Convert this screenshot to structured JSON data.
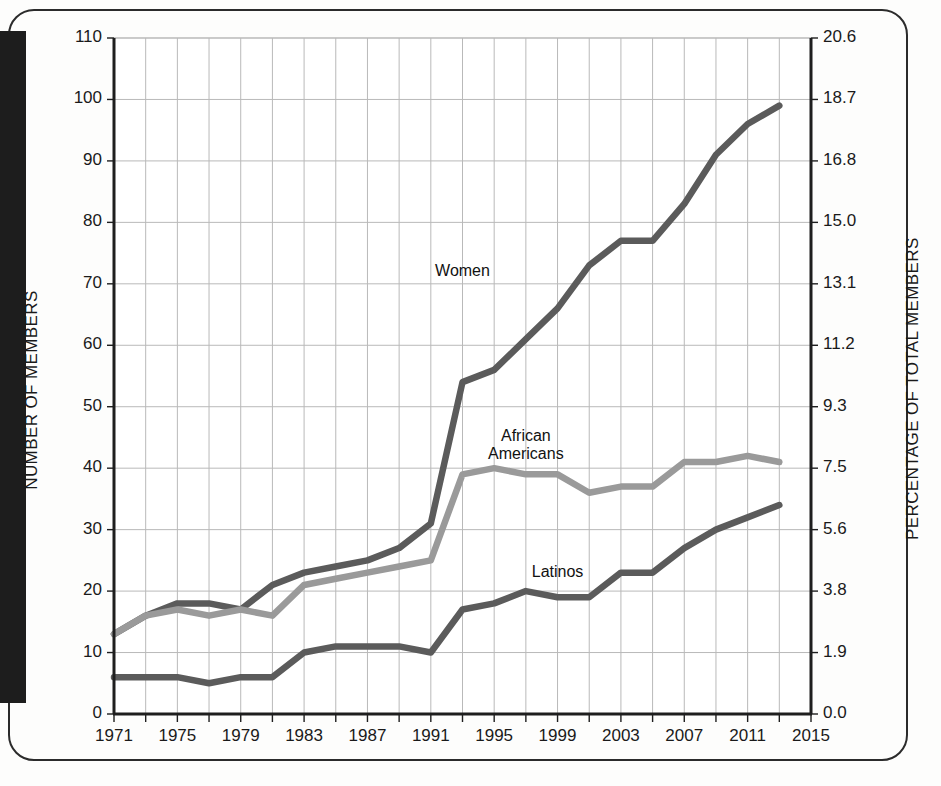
{
  "chart_data": {
    "type": "line",
    "title": "",
    "xlabel": "",
    "ylabel": "NUMBER OF MEMBERS",
    "ylabel_right": "PERCENTAGE OF TOTAL MEMBERS",
    "grid": true,
    "legend_position": "inline-labels",
    "xlim": [
      1971,
      2015
    ],
    "ylim": [
      0,
      110
    ],
    "ylim_right": [
      0.0,
      20.6
    ],
    "xticks": [
      1971,
      1975,
      1979,
      1983,
      1987,
      1991,
      1995,
      1999,
      2003,
      2007,
      2011,
      2015
    ],
    "xtick_labels": [
      "1971",
      "1975",
      "1979",
      "1983",
      "1987",
      "1991",
      "1995",
      "1999",
      "2003",
      "2007",
      "2011",
      "2015"
    ],
    "x_gridline_interval": 2,
    "yticks": [
      0,
      10,
      20,
      30,
      40,
      50,
      60,
      70,
      80,
      90,
      100,
      110
    ],
    "ytick_labels": [
      "0",
      "10",
      "20",
      "30",
      "40",
      "50",
      "60",
      "70",
      "80",
      "90",
      "100",
      "110"
    ],
    "yticks_right": [
      0.0,
      1.9,
      3.8,
      5.6,
      7.5,
      9.3,
      11.2,
      13.1,
      15.0,
      16.8,
      18.7,
      20.6
    ],
    "ytick_labels_right": [
      "0.0",
      "1.9",
      "3.8",
      "5.6",
      "7.5",
      "9.3",
      "11.2",
      "13.1",
      "15.0",
      "16.8",
      "18.7",
      "20.6"
    ],
    "x": [
      1971,
      1973,
      1975,
      1977,
      1979,
      1981,
      1983,
      1985,
      1987,
      1989,
      1991,
      1993,
      1995,
      1997,
      1999,
      2001,
      2003,
      2005,
      2007,
      2009,
      2011,
      2013
    ],
    "series": [
      {
        "name": "Women",
        "color": "#5b5b5b",
        "label_x": 1993,
        "label_y": 72,
        "values": [
          13,
          16,
          18,
          18,
          17,
          21,
          23,
          24,
          25,
          27,
          31,
          54,
          56,
          61,
          66,
          73,
          77,
          77,
          83,
          91,
          96,
          99
        ]
      },
      {
        "name": "African Americans",
        "color": "#9a9a9a",
        "label_x": 1997,
        "label_y": 45,
        "values": [
          13,
          16,
          17,
          16,
          17,
          16,
          21,
          22,
          23,
          24,
          25,
          39,
          40,
          39,
          39,
          36,
          37,
          37,
          41,
          41,
          42,
          41
        ]
      },
      {
        "name": "Latinos",
        "color": "#5b5b5b",
        "label_x": 1999,
        "label_y": 23,
        "values": [
          6,
          6,
          6,
          5,
          6,
          6,
          10,
          11,
          11,
          11,
          10,
          17,
          18,
          20,
          19,
          19,
          23,
          23,
          27,
          30,
          32,
          34
        ]
      }
    ]
  },
  "axis_titles": {
    "left": "NUMBER OF MEMBERS",
    "right": "PERCENTAGE OF TOTAL MEMBERS"
  }
}
